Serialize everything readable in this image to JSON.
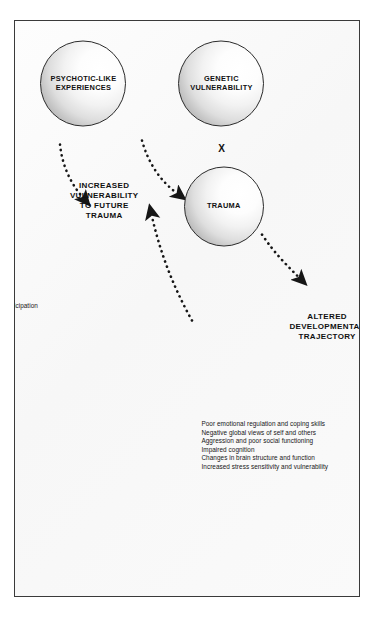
{
  "figure": {
    "type": "cyclical-conceptual-diagram",
    "colors": {
      "border": "#3a3a3a",
      "background": "#fbfbfb",
      "text": "#111111",
      "sphere_outline": "#2b2b2b",
      "arrow": "#1a1a1a"
    }
  },
  "nodes": {
    "genetic_vulnerability": "GENETIC\nVULNERABILITY",
    "multiply_operator": "X",
    "trauma": "TRAUMA",
    "psychotic_like_experiences": "PSYCHOTIC-LIKE\nEXPERIENCES"
  },
  "outcomes": {
    "altered_trajectory": {
      "heading": "ALTERED\nDEVELOPMENTAL\nTRAJECTORY",
      "items": "Poor emotional regulation and coping skills\nNegative global views of self and others\nAggression and poor social functioning\nImpaired cognition\nChanges in brain structure and function\nIncreased stress sensitivity and vulnerability"
    },
    "increased_vulnerability": {
      "heading": "INCREASED\nVULNERABILITY\nTO FUTURE\nTRAUMA",
      "items": "Hypervigilance and reactivity to threat\nAffirmed faulty cognitions\nIncreased cognitive impairment\n  (e.g., executive control, social cognition)\nIncreased high-risk behaviors\n  (e.g., substance use, crime)\nPoor social and role functioning\nDecreased treatment adherence and participation\nReduced social support\nComorbid conditions\n  (e.g., mood/anxiety disorders, PTSD)"
    }
  },
  "arrows": [
    {
      "name": "trauma-to-altered-trajectory",
      "style": "dotted",
      "head": "solid-triangle"
    },
    {
      "name": "altered-trajectory-to-psychotic-like-experiences",
      "style": "dotted",
      "head": "solid-triangle"
    },
    {
      "name": "psychotic-like-experiences-to-increased-vulnerability",
      "style": "dotted",
      "head": "solid-triangle"
    },
    {
      "name": "increased-vulnerability-to-trauma",
      "style": "dotted",
      "head": "solid-triangle"
    }
  ]
}
